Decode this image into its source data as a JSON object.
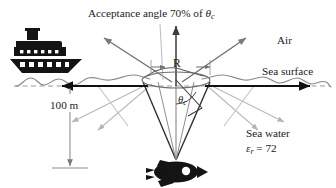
{
  "figure": {
    "background_color": "#ffffff",
    "title_label": "Acceptance angle 70% of θc",
    "labels": {
      "acceptance_angle": {
        "text_plain": "Acceptance angle 70% of ",
        "symbol": "θ",
        "symbol_sub": "c"
      },
      "air": "Air",
      "sea_surface": "Sea surface",
      "depth": "100 m",
      "sea_water": "Sea water",
      "permittivity": {
        "symbol": "ε",
        "symbol_sub": "r",
        "equals": " = ",
        "value": "72"
      },
      "radius": "R",
      "critical_angle": {
        "symbol": "θ",
        "symbol_sub": "c"
      }
    },
    "icons": {
      "ship": "ship-icon",
      "submarine": "submarine-fish-icon"
    },
    "colors": {
      "ink": "#1c1c1c",
      "dark_ray": "#3b3b3b",
      "mid_ray": "#7a7a7a",
      "light_ray": "#b4b4b4",
      "surface_line": "#8a8a8a",
      "dashed_line": "#9a9a9a",
      "cone_dark": "#2b2b2b",
      "ellipse": "#6f6f6f"
    },
    "geometry": {
      "surface_y": 86,
      "cone_apex": {
        "x": 176,
        "y": 162
      },
      "ellipse_center": {
        "x": 176,
        "y": 80
      },
      "ellipse_rx": 34,
      "ellipse_ry": 8,
      "radius_arrow": {
        "from_x": 176,
        "to_x": 210,
        "y": 67
      },
      "depth_arrow": {
        "x": 70,
        "from_y": 112,
        "to_y": 168
      }
    }
  }
}
